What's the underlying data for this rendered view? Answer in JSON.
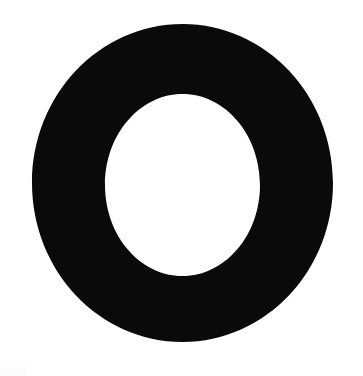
{
  "canvas": {
    "width": 363,
    "height": 376,
    "background_color": "#ffffff",
    "alt_text": "O"
  },
  "glyph": {
    "name": "letter-o-ring",
    "character": "O",
    "description": "Solid black ring (letter O glyph) centered on a white background",
    "fill_color": "#0a0a0a",
    "outer_ellipse": {
      "cx": 182.5,
      "cy": 183,
      "rx": 150.5,
      "ry": 159,
      "left": 32,
      "right": 333,
      "top": 24,
      "bottom": 342
    },
    "inner_ellipse": {
      "cx": 182.5,
      "cy": 185,
      "rx": 77.5,
      "ry": 91,
      "left": 105,
      "right": 260,
      "top": 94,
      "bottom": 276
    },
    "stroke_thickness": {
      "left": 73,
      "right": 73,
      "top": 70,
      "bottom": 66
    }
  },
  "artifacts": {
    "corner_tint_color": "#fcfcfc",
    "corner_tint_position": "bottom-left"
  }
}
